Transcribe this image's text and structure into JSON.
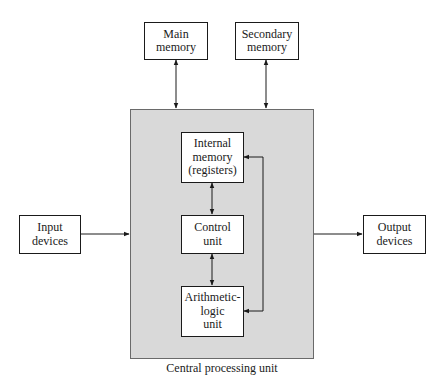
{
  "diagram": {
    "title": "Central processing unit",
    "external": {
      "main_memory": {
        "line1": "Main",
        "line2": "memory"
      },
      "secondary_memory": {
        "line1": "Secondary",
        "line2": "memory"
      },
      "input_devices": {
        "line1": "Input",
        "line2": "devices"
      },
      "output_devices": {
        "line1": "Output",
        "line2": "devices"
      }
    },
    "cpu": {
      "label": "Central processing unit",
      "internal_memory": {
        "line1": "Internal",
        "line2": "memory",
        "line3": "(registers)"
      },
      "control_unit": {
        "line1": "Control",
        "line2": "unit"
      },
      "alu": {
        "line1": "Arithmetic-",
        "line2": "logic",
        "line3": "unit"
      }
    },
    "connections": [
      {
        "from": "Main memory",
        "to": "Central processing unit",
        "direction": "bidirectional"
      },
      {
        "from": "Secondary memory",
        "to": "Central processing unit",
        "direction": "bidirectional"
      },
      {
        "from": "Input devices",
        "to": "Central processing unit",
        "direction": "one-way"
      },
      {
        "from": "Central processing unit",
        "to": "Output devices",
        "direction": "one-way"
      },
      {
        "from": "Internal memory (registers)",
        "to": "Control unit",
        "direction": "bidirectional"
      },
      {
        "from": "Control unit",
        "to": "Arithmetic-logic unit",
        "direction": "bidirectional"
      },
      {
        "from": "Internal memory (registers)",
        "to": "Arithmetic-logic unit",
        "direction": "bidirectional"
      }
    ],
    "colors": {
      "cpu_fill": "#d9d9d9",
      "box_fill": "#ffffff",
      "line": "#1a1a1a"
    }
  }
}
